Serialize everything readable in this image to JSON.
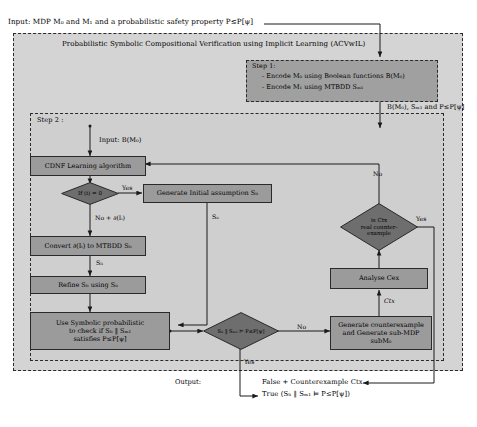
{
  "diagram": {
    "title": "Probabilistic Symbolic Compositional Verification using Implicit Learning (ACVwIL)",
    "input_line": "Input: MDP M₀ and M₁ and a probabilistic safety property P≤P[ψ]",
    "output_label": "Output:",
    "step1": {
      "header": "Step 1:",
      "line1": "- Encode M₀ using Boolean functions B(M₀)",
      "line2": "- Encode M₁ using MTBDD Sₘ₁"
    },
    "step1_out_label": "B(M₀), Sₘ₁ and P≤P[ψ]",
    "step2": {
      "header": "Step 2 :",
      "input_label": "Input:  B(M₀)"
    },
    "nodes": {
      "cdnf": "CDNF Learning algorithm",
      "gen_initial": "Generate Initial assumption Sₗᵢ",
      "convert": "Convert ∂(Iᵢ) to MTBDD Sₗᵢ",
      "refine": "Refine Sₗᵢ using Sᵢᵢ",
      "symbolic_l1": "Use Symbolic probabilistic",
      "symbolic_l2": "to check if Sₗᵢ ‖ Sₘ₁",
      "symbolic_l3": "satisfies P≤P[ψ]",
      "analyse": "Analyse Cex",
      "gen_cex_l1": "Generate counterexample",
      "gen_cex_l2": "and Generate sub-MDP",
      "gen_cex_l3": "subM₀"
    },
    "decisions": {
      "if_i_zero": "If (i) = 0",
      "is_ctx_l1": "is Ctx",
      "is_ctx_l2": "real counter-",
      "is_ctx_l3": "example",
      "satisfies": "Sₗᵢ ‖ Sₘ₁ ⊨ P≤P[ψ]"
    },
    "edges": {
      "yes_initial": "Yes",
      "no_partial": "No + ∂(Iᵢ)",
      "s_li_down_1": "Sₗᵢ",
      "s_ii_feedback": "Sᵢᵢ",
      "no_right_loop": "No",
      "yes_ctx": "Yes",
      "no_sat": "No",
      "yes_sat": "Yes",
      "ctx": "Ctx"
    },
    "outputs": {
      "false_branch": "False + Counterexample Ctx",
      "true_branch": "True (Sₗᵢ ‖ Sₘ₁ ⊨ P≤P[ψ])"
    },
    "colors": {
      "node_fill": "#9b9b9b",
      "outer_fill": "#d4d4d4",
      "step_fill": "#cfcfcf",
      "stroke": "#2a2a2a"
    }
  }
}
